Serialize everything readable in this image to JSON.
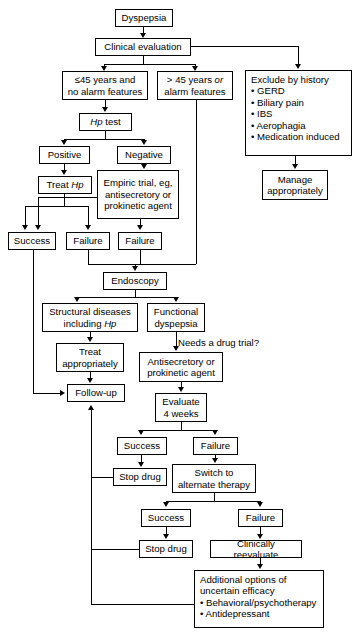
{
  "diagram": {
    "type": "flowchart",
    "nodes": {
      "dyspepsia": "Dyspepsia",
      "clinical_evaluation": "Clinical evaluation",
      "young_no_alarm": "≤45 years and\nno alarm features",
      "older_or_alarm_line1": "> 45 years ",
      "older_or_alarm_or": "or",
      "older_or_alarm_line2": "alarm features",
      "exclude_title": "Exclude by history",
      "exclude_items": [
        "• GERD",
        "• Biliary pain",
        "• IBS",
        "• Aerophagia",
        "• Medication induced"
      ],
      "manage_appropriately": "Manage\nappropriately",
      "hp_test_italic": "Hp",
      "hp_test_rest": " test",
      "positive": "Positive",
      "negative": "Negative",
      "treat_hp_pre": "Treat ",
      "treat_hp_italic": "Hp",
      "empiric_trial": "Empiric trial, eg,\nantisecretory or\nprokinetic agent",
      "success_1": "Success",
      "failure_1": "Failure",
      "failure_2": "Failure",
      "endoscopy": "Endoscopy",
      "structural_line1": "Structural diseases",
      "structural_line2_pre": "including ",
      "structural_line2_italic": "Hp",
      "functional_dyspepsia": "Functional\ndyspepsia",
      "needs_drug_trial": "Needs a drug trial?",
      "treat_appropriately": "Treat\nappropriately",
      "follow_up": "Follow-up",
      "antisecretory_prokinetic": "Antisecretory or\nprokinetic agent",
      "evaluate_4_weeks": "Evaluate\n4 weeks",
      "success_2": "Success",
      "failure_3": "Failure",
      "stop_drug_1": "Stop drug",
      "switch_alternate": "Switch to\nalternate therapy",
      "success_3": "Success",
      "failure_4": "Failure",
      "stop_drug_2": "Stop drug",
      "clinically_reevaluate": "Clinically reevaluate",
      "additional_title_line1": "Additional options of",
      "additional_title_line2": "uncertain efficacy",
      "additional_items": [
        "• Behavioral/psychotherapy",
        "• Antidepressant"
      ]
    },
    "colors": {
      "stroke": "#000000",
      "fill": "#ffffff",
      "text": "#000000"
    }
  }
}
